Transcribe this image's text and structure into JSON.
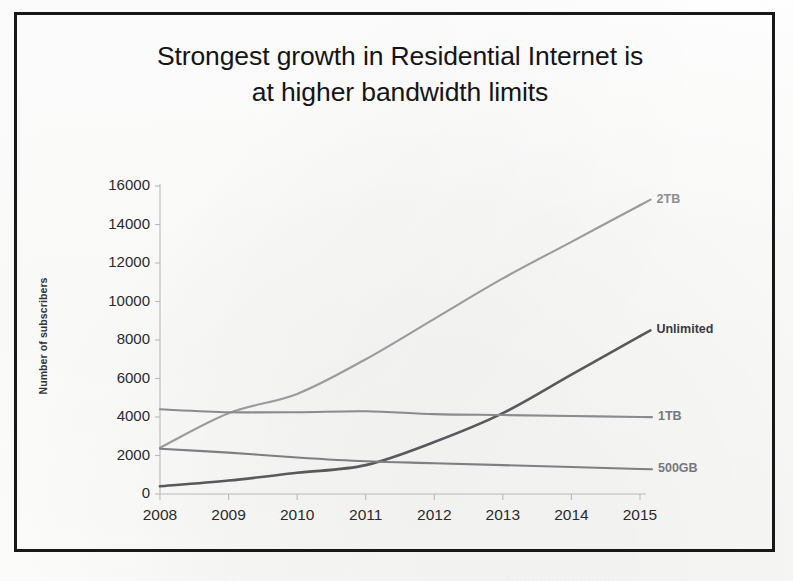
{
  "slide": {
    "title_line1": "Strongest growth in Residential Internet is",
    "title_line2": "at higher bandwidth limits",
    "border_color": "#17181a",
    "background_color": "#ffffff"
  },
  "chart_data": {
    "type": "line",
    "title": "Strongest growth in Residential Internet is at higher bandwidth limits",
    "xlabel": "",
    "ylabel": "Number of subscribers",
    "categories": [
      "2008",
      "2009",
      "2010",
      "2011",
      "2012",
      "2013",
      "2014",
      "2015"
    ],
    "x": [
      2008,
      2009,
      2010,
      2011,
      2012,
      2013,
      2014,
      2015
    ],
    "ylim": [
      0,
      16000
    ],
    "xlim": [
      2008,
      2015
    ],
    "ytick_labels": [
      "16000",
      "14000",
      "12000",
      "10000",
      "8000",
      "6000",
      "4000",
      "2000",
      "0"
    ],
    "ytick_values": [
      16000,
      14000,
      12000,
      10000,
      8000,
      6000,
      4000,
      2000,
      0
    ],
    "grid": false,
    "legend_position": "right-inline-labels",
    "series": [
      {
        "name": "2TB",
        "color": "#9a9a9f",
        "label_style": "light",
        "values": [
          2400,
          4200,
          5200,
          7000,
          9100,
          11200,
          13100,
          15000
        ]
      },
      {
        "name": "Unlimited",
        "color": "#58585d",
        "label_style": "dark",
        "values": [
          400,
          700,
          1100,
          1500,
          2700,
          4200,
          6200,
          8200
        ]
      },
      {
        "name": "1TB",
        "color": "#8a8a8f",
        "label_style": "mid",
        "values": [
          4400,
          4250,
          4250,
          4300,
          4150,
          4100,
          4050,
          4000
        ]
      },
      {
        "name": "500GB",
        "color": "#7e7e83",
        "label_style": "mid",
        "values": [
          2350,
          2150,
          1900,
          1700,
          1600,
          1500,
          1400,
          1300
        ]
      }
    ]
  }
}
